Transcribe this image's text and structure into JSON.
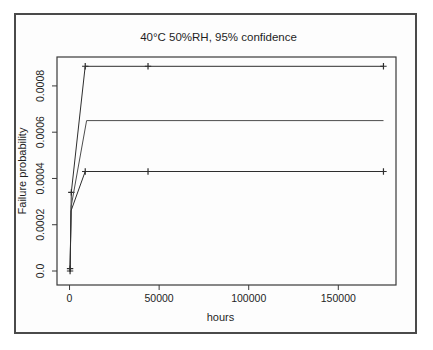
{
  "figure": {
    "title": "40°C 50%RH, 95% confidence",
    "xlabel": "hours",
    "ylabel": "Failure probability"
  },
  "chart_data": {
    "type": "line",
    "title": "40°C 50%RH, 95% confidence",
    "xlabel": "hours",
    "ylabel": "Failure probability",
    "xlim": [
      -7000,
      182200
    ],
    "ylim": [
      -6.05e-05,
      0.000925
    ],
    "x_ticks": [
      0,
      50000,
      100000,
      150000
    ],
    "x_tick_labels": [
      "0",
      "50000",
      "100000",
      "150000"
    ],
    "y_ticks": [
      0.0,
      0.0002,
      0.0004,
      0.0006,
      0.0008
    ],
    "y_tick_labels": [
      "0.0",
      "0.0002",
      "0.0004",
      "0.0006",
      "0.0008"
    ],
    "grid": false,
    "legend": null,
    "marker_glyph": "plus",
    "colors": {
      "line": "#2e2e2e",
      "estimate_line": "#4d4d4d",
      "axis": "#3a3a3a",
      "text": "#1f1f1f"
    },
    "series": [
      {
        "name": "upper-95-bound",
        "marker": "plus",
        "points": [
          [
            300,
            1e-05
          ],
          [
            1000,
            0.00034
          ],
          [
            8760,
            0.000885
          ],
          [
            43800,
            0.000885
          ],
          [
            175200,
            0.000885
          ]
        ],
        "marker_points": [
          [
            300,
            1e-05
          ],
          [
            1000,
            0.00034
          ],
          [
            8760,
            0.000885
          ],
          [
            43800,
            0.000885
          ],
          [
            175200,
            0.000885
          ]
        ]
      },
      {
        "name": "estimate",
        "marker": "none",
        "points": [
          [
            300,
            5e-06
          ],
          [
            900,
            0.00028
          ],
          [
            9500,
            0.00065
          ],
          [
            175200,
            0.00065
          ]
        ],
        "marker_points": []
      },
      {
        "name": "lower-95-bound",
        "marker": "plus",
        "points": [
          [
            300,
            0.0
          ],
          [
            800,
            0.00026
          ],
          [
            8760,
            0.00043
          ],
          [
            43800,
            0.00043
          ],
          [
            175200,
            0.00043
          ]
        ],
        "marker_points": [
          [
            300,
            0.0
          ],
          [
            8760,
            0.00043
          ],
          [
            43800,
            0.00043
          ],
          [
            175200,
            0.00043
          ]
        ]
      }
    ]
  }
}
